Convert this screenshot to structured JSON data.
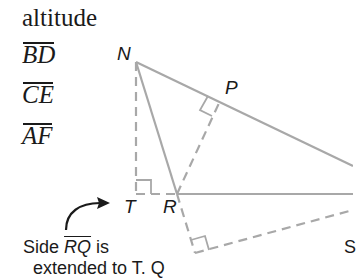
{
  "heading": "altitude",
  "segments": [
    {
      "label": "BD"
    },
    {
      "label": "CE"
    },
    {
      "label": "AF"
    }
  ],
  "figure": {
    "points": {
      "N": "N",
      "P": "P",
      "T": "T",
      "R": "R",
      "Q": "Q"
    },
    "colors": {
      "line": "#a8a8a8",
      "text": "#1a1a1a"
    }
  },
  "note": {
    "prefix": "Side ",
    "segment": "RQ",
    "suffix": " is",
    "line2": "extended to T.  Q"
  },
  "cut_label": "S"
}
